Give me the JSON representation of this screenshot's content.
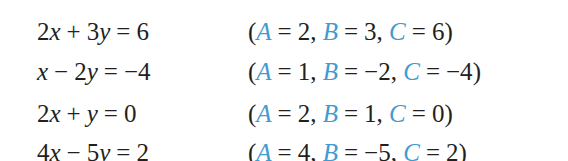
{
  "accent_color": "#3f9bd1",
  "text_color": "#231f20",
  "rows": [
    {
      "equation": {
        "parts": [
          "2",
          "x",
          "+",
          "3",
          "y",
          "=",
          "6"
        ],
        "text": "2x + 3y = 6"
      },
      "coefficients": {
        "A": "2",
        "B": "3",
        "C": "6"
      }
    },
    {
      "equation": {
        "parts": [
          "",
          "x",
          "−",
          "2",
          "y",
          "=",
          "−4"
        ],
        "text": "x − 2y = −4"
      },
      "coefficients": {
        "A": "1",
        "B": "−2",
        "C": "−4"
      }
    },
    {
      "equation": {
        "parts": [
          "2",
          "x",
          "+",
          "",
          "y",
          "=",
          "0"
        ],
        "text": "2x + y = 0"
      },
      "coefficients": {
        "A": "2",
        "B": "1",
        "C": "0"
      }
    },
    {
      "equation": {
        "parts": [
          "4",
          "x",
          "−",
          "5",
          "y",
          "=",
          "2"
        ],
        "text": "4x − 5y = 2"
      },
      "coefficients": {
        "A": "4",
        "B": "−5",
        "C": "2"
      }
    }
  ],
  "labels": {
    "A": "A",
    "B": "B",
    "C": "C",
    "equals": "=",
    "open_paren": "(",
    "close_paren": ")",
    "comma": ","
  }
}
